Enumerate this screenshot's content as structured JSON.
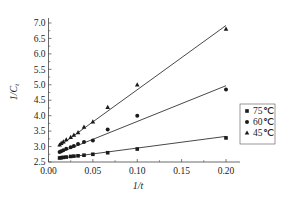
{
  "chart_data": {
    "type": "scatter",
    "title": "",
    "xlabel": "1/t",
    "ylabel": "1/Ct",
    "xlim": [
      0.0,
      0.2
    ],
    "ylim": [
      2.5,
      7.0
    ],
    "xticks": [
      "0.00",
      "0.05",
      "0.10",
      "0.15",
      "0.20"
    ],
    "yticks": [
      "2.5",
      "3.0",
      "3.5",
      "4.0",
      "4.5",
      "5.0",
      "5.5",
      "6.0",
      "6.5",
      "7.0"
    ],
    "grid": false,
    "legend_position": "right",
    "series": [
      {
        "name": "75℃",
        "marker": "square",
        "x": [
          0.0125,
          0.0143,
          0.0167,
          0.02,
          0.025,
          0.0286,
          0.0333,
          0.04,
          0.05,
          0.0667,
          0.1,
          0.2
        ],
        "y": [
          2.63,
          2.64,
          2.65,
          2.66,
          2.68,
          2.69,
          2.7,
          2.72,
          2.75,
          2.8,
          2.92,
          3.28
        ],
        "fit": {
          "x0": 0.0125,
          "y0": 2.62,
          "x1": 0.2,
          "y1": 3.33
        }
      },
      {
        "name": "60℃",
        "marker": "circle",
        "x": [
          0.0125,
          0.0143,
          0.0167,
          0.02,
          0.025,
          0.0286,
          0.0333,
          0.04,
          0.05,
          0.0667,
          0.1,
          0.2
        ],
        "y": [
          2.82,
          2.85,
          2.88,
          2.93,
          2.98,
          3.02,
          3.08,
          3.15,
          3.2,
          3.55,
          4.0,
          4.85
        ],
        "fit": {
          "x0": 0.0125,
          "y0": 2.8,
          "x1": 0.2,
          "y1": 4.97
        }
      },
      {
        "name": "45℃",
        "marker": "triangle",
        "x": [
          0.0125,
          0.0143,
          0.0167,
          0.02,
          0.025,
          0.0286,
          0.0333,
          0.04,
          0.05,
          0.0667,
          0.1,
          0.2
        ],
        "y": [
          3.05,
          3.1,
          3.15,
          3.22,
          3.3,
          3.37,
          3.45,
          3.63,
          3.8,
          4.27,
          5.0,
          6.8
        ],
        "fit": {
          "x0": 0.0125,
          "y0": 3.02,
          "x1": 0.2,
          "y1": 6.92
        }
      }
    ]
  },
  "legend": {
    "items": [
      {
        "label": "75℃",
        "marker": "■"
      },
      {
        "label": "60℃",
        "marker": "●"
      },
      {
        "label": "45℃",
        "marker": "▲"
      }
    ]
  },
  "axes": {
    "x_title": "1/t",
    "y_title_main": "1/C",
    "y_title_sub": "t"
  },
  "colors": {
    "ink": "#1a1a1a",
    "line": "#333333"
  }
}
